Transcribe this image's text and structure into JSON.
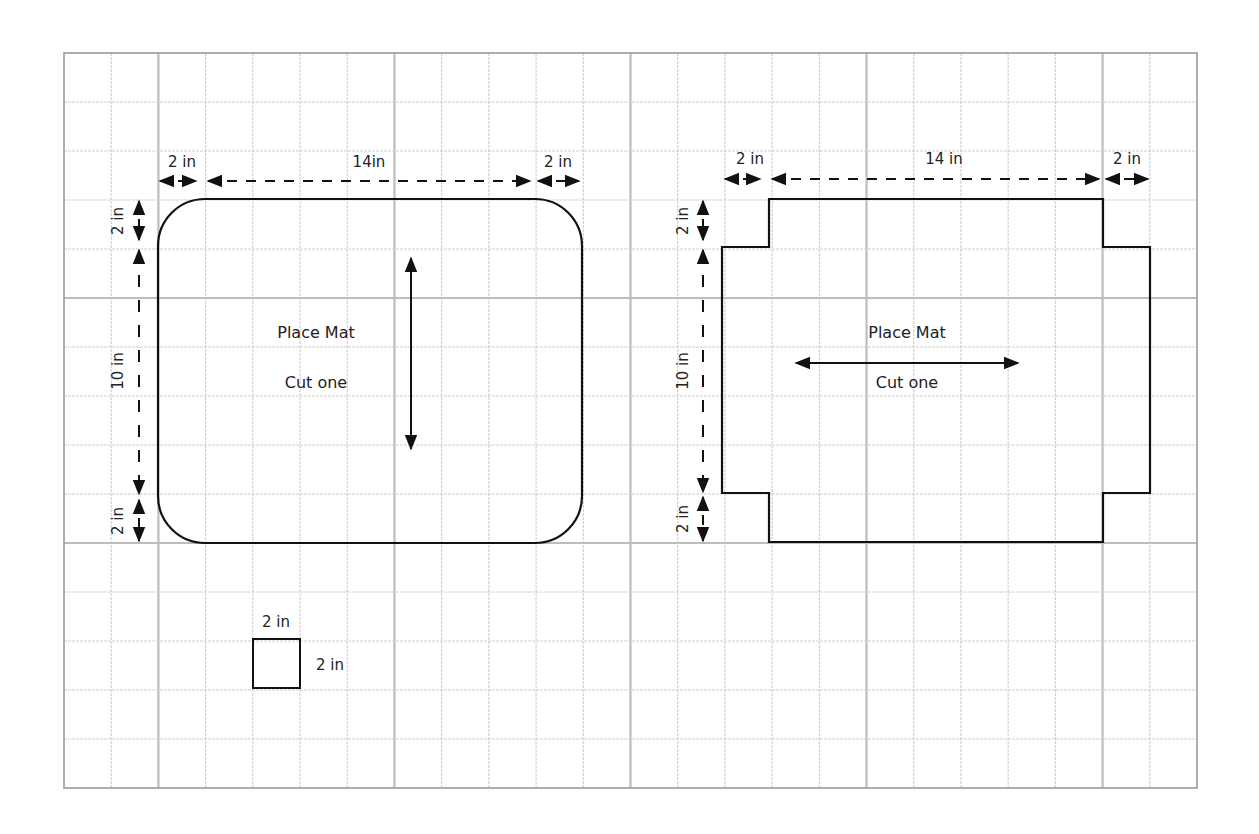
{
  "grid": {
    "left": 64,
    "top": 53,
    "right": 1197,
    "bottom": 788,
    "columns": 24,
    "rows": 15,
    "minor_color": "#cfcfcf",
    "major_color": "#bdbdbd",
    "border_color": "#9a9a9a",
    "major_columns": [
      2,
      7,
      12,
      17,
      22
    ],
    "major_rows": [
      5,
      10
    ]
  },
  "colors": {
    "outline": "#111111",
    "text": "#222222"
  },
  "left_pattern": {
    "name": "Place Mat",
    "instruction": "Cut one",
    "corner_style": "rounded",
    "grain_arrow": "vertical",
    "dims": {
      "top_left": "2 in",
      "top_middle": "14in",
      "top_right": "2 in",
      "side_top": "2 in",
      "side_middle": "10 in",
      "side_bottom": "2 in"
    }
  },
  "right_pattern": {
    "name": "Place Mat",
    "instruction": "Cut one",
    "corner_style": "notched",
    "grain_arrow": "horizontal",
    "dims": {
      "top_left": "2 in",
      "top_middle": "14 in",
      "top_right": "2 in",
      "side_top": "2 in",
      "side_middle": "10 in",
      "side_bottom": "2 in"
    }
  },
  "corner_template": {
    "width_label": "2 in",
    "height_label": "2 in"
  }
}
